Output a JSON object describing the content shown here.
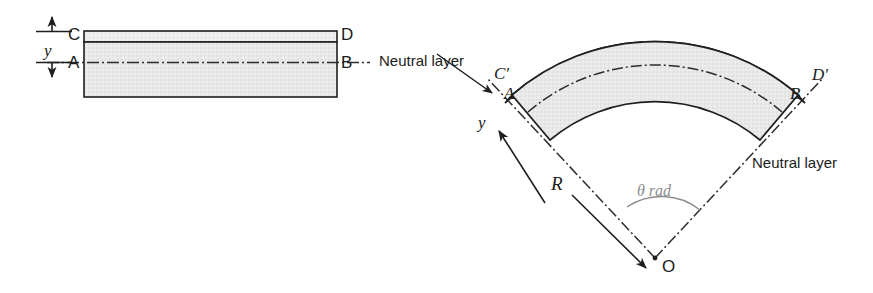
{
  "figure": {
    "background_color": "#ffffff",
    "line_color": "#1f1f1f",
    "fill_color": "#e8e8e8",
    "accent_gray": "#8d8d8d"
  },
  "left_diagram": {
    "name": "straight-beam",
    "labels": {
      "corner_top_left": "C",
      "corner_top_right": "D",
      "corner_mid_left": "A",
      "corner_mid_right": "B",
      "dimension_y": "y",
      "neutral_layer": "Neutral layer"
    }
  },
  "right_diagram": {
    "name": "bent-beam",
    "labels": {
      "corner_top_left": "C′",
      "corner_top_right": "D′",
      "corner_mid_left": "A",
      "corner_mid_right": "B",
      "dimension_y": "y",
      "radius": "R",
      "angle": "θ rad",
      "center": "O",
      "neutral_layer": "Neutral layer"
    }
  }
}
